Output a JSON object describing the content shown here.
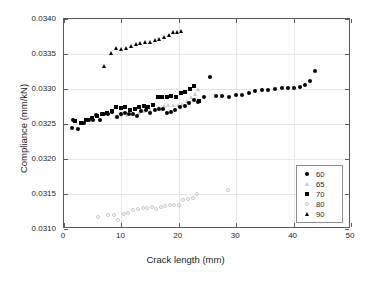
{
  "chart_data": {
    "type": "scatter",
    "title": "",
    "xlabel": "Crack length (mm)",
    "ylabel": "Compliance (mm/kN)",
    "xlim": [
      0,
      50
    ],
    "ylim": [
      0.031,
      0.034
    ],
    "xticks": [
      "0",
      "10",
      "20",
      "30",
      "40",
      "50"
    ],
    "xtick_values": [
      0,
      10,
      20,
      30,
      40,
      50
    ],
    "yticks": [
      "0.0310",
      "0.0315",
      "0.0320",
      "0.0325",
      "0.0330",
      "0.0335",
      "0.0340"
    ],
    "ytick_values": [
      0.031,
      0.0315,
      0.032,
      0.0325,
      0.033,
      0.0335,
      0.034
    ],
    "grid": true,
    "legend_position": "lower right",
    "series": [
      {
        "name": "60",
        "marker": "circle-filled",
        "color": "#000000",
        "points": [
          [
            1.4,
            0.03245
          ],
          [
            1.6,
            0.032555
          ],
          [
            2.4,
            0.032425
          ],
          [
            2.9,
            0.03252
          ],
          [
            3.4,
            0.032515
          ],
          [
            4.3,
            0.03256
          ],
          [
            5.0,
            0.032555
          ],
          [
            5.6,
            0.03263
          ],
          [
            6.2,
            0.03256
          ],
          [
            7.0,
            0.03265
          ],
          [
            7.6,
            0.032645
          ],
          [
            8.4,
            0.032665
          ],
          [
            9.2,
            0.0326
          ],
          [
            9.9,
            0.03264
          ],
          [
            10.6,
            0.03266
          ],
          [
            11.3,
            0.03264
          ],
          [
            12.0,
            0.03265
          ],
          [
            12.7,
            0.03261
          ],
          [
            13.4,
            0.03269
          ],
          [
            14.2,
            0.0327
          ],
          [
            15.0,
            0.03266
          ],
          [
            15.8,
            0.0327
          ],
          [
            16.5,
            0.032715
          ],
          [
            17.2,
            0.03272
          ],
          [
            17.9,
            0.03266
          ],
          [
            18.6,
            0.032665
          ],
          [
            19.4,
            0.0327
          ],
          [
            20.2,
            0.03274
          ],
          [
            21.0,
            0.03276
          ],
          [
            21.8,
            0.0328
          ],
          [
            22.6,
            0.03284
          ],
          [
            23.4,
            0.03282
          ],
          [
            24.4,
            0.03288
          ],
          [
            25.4,
            0.033175
          ],
          [
            26.5,
            0.032895
          ],
          [
            27.6,
            0.0329
          ],
          [
            28.7,
            0.03289
          ],
          [
            29.9,
            0.032915
          ],
          [
            31.0,
            0.03292
          ],
          [
            32.2,
            0.03294
          ],
          [
            33.3,
            0.032965
          ],
          [
            34.5,
            0.03298
          ],
          [
            35.6,
            0.03299
          ],
          [
            36.8,
            0.033
          ],
          [
            37.9,
            0.03301
          ],
          [
            39.0,
            0.033015
          ],
          [
            40.1,
            0.03302
          ],
          [
            41.2,
            0.033025
          ],
          [
            42.0,
            0.033055
          ],
          [
            42.9,
            0.03311
          ],
          [
            43.8,
            0.033255
          ]
        ]
      },
      {
        "name": "65",
        "marker": "triangle-open",
        "color": "#c9c9c9",
        "points": [
          [
            9.0,
            0.032615
          ],
          [
            10.0,
            0.03263
          ],
          [
            11.0,
            0.032625
          ],
          [
            12.0,
            0.03264
          ],
          [
            13.0,
            0.03266
          ],
          [
            14.0,
            0.03268
          ],
          [
            15.0,
            0.0327
          ],
          [
            15.8,
            0.03271
          ],
          [
            16.6,
            0.032725
          ],
          [
            17.4,
            0.032755
          ],
          [
            18.2,
            0.032765
          ],
          [
            19.0,
            0.03277
          ],
          [
            19.8,
            0.032775
          ],
          [
            20.6,
            0.03279
          ],
          [
            21.4,
            0.03283
          ],
          [
            22.2,
            0.03288
          ],
          [
            22.8,
            0.032925
          ],
          [
            23.4,
            0.032995
          ]
        ]
      },
      {
        "name": "70",
        "marker": "square-filled",
        "color": "#000000",
        "points": [
          [
            2.0,
            0.03254
          ],
          [
            3.0,
            0.03252
          ],
          [
            3.9,
            0.032555
          ],
          [
            4.8,
            0.03259
          ],
          [
            5.7,
            0.03261
          ],
          [
            6.6,
            0.03265
          ],
          [
            7.5,
            0.03266
          ],
          [
            8.3,
            0.03268
          ],
          [
            9.1,
            0.032745
          ],
          [
            9.9,
            0.032735
          ],
          [
            10.7,
            0.032745
          ],
          [
            11.5,
            0.0327
          ],
          [
            12.3,
            0.03272
          ],
          [
            13.1,
            0.03275
          ],
          [
            13.9,
            0.03276
          ],
          [
            14.7,
            0.032745
          ],
          [
            15.5,
            0.03277
          ],
          [
            16.3,
            0.03289
          ],
          [
            17.1,
            0.03288
          ],
          [
            17.9,
            0.03289
          ],
          [
            18.7,
            0.032895
          ],
          [
            19.5,
            0.03289
          ],
          [
            20.3,
            0.03294
          ],
          [
            21.1,
            0.032955
          ],
          [
            21.9,
            0.033
          ],
          [
            22.7,
            0.033045
          ],
          [
            23.5,
            0.032825
          ]
        ]
      },
      {
        "name": "80",
        "marker": "circle-open",
        "color": "#c9c9c9",
        "points": [
          [
            6.0,
            0.031165
          ],
          [
            7.7,
            0.031205
          ],
          [
            8.7,
            0.0312
          ],
          [
            9.4,
            0.031135
          ],
          [
            10.4,
            0.031215
          ],
          [
            11.2,
            0.031225
          ],
          [
            12.0,
            0.031265
          ],
          [
            12.9,
            0.03129
          ],
          [
            13.7,
            0.0313
          ],
          [
            14.5,
            0.031295
          ],
          [
            15.3,
            0.03132
          ],
          [
            16.1,
            0.03129
          ],
          [
            16.9,
            0.03132
          ],
          [
            17.6,
            0.03133
          ],
          [
            18.4,
            0.031345
          ],
          [
            19.2,
            0.03135
          ],
          [
            20.0,
            0.031345
          ],
          [
            20.8,
            0.03142
          ],
          [
            21.6,
            0.03143
          ],
          [
            22.4,
            0.03145
          ],
          [
            23.2,
            0.031505
          ],
          [
            28.6,
            0.03156
          ]
        ]
      },
      {
        "name": "90",
        "marker": "triangle-filled",
        "color": "#000000",
        "points": [
          [
            7.0,
            0.033325
          ],
          [
            8.2,
            0.033515
          ],
          [
            9.0,
            0.03358
          ],
          [
            10.0,
            0.03357
          ],
          [
            10.8,
            0.033585
          ],
          [
            11.6,
            0.03362
          ],
          [
            12.5,
            0.03364
          ],
          [
            13.3,
            0.03366
          ],
          [
            14.1,
            0.033675
          ],
          [
            15.0,
            0.03367
          ],
          [
            15.8,
            0.033705
          ],
          [
            16.6,
            0.03371
          ],
          [
            17.5,
            0.033745
          ],
          [
            18.3,
            0.03377
          ],
          [
            19.0,
            0.03381
          ],
          [
            19.7,
            0.033815
          ],
          [
            20.3,
            0.03383
          ]
        ]
      }
    ],
    "legend": [
      {
        "label": "60",
        "marker": "circle-filled"
      },
      {
        "label": "65",
        "marker": "triangle-open"
      },
      {
        "label": "70",
        "marker": "square-filled"
      },
      {
        "label": "80",
        "marker": "circle-open"
      },
      {
        "label": "90",
        "marker": "triangle-filled"
      }
    ]
  }
}
